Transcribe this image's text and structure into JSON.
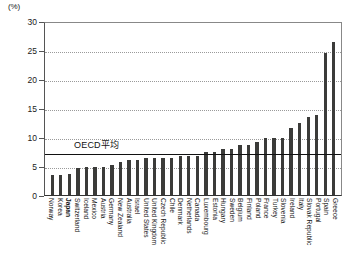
{
  "axis": {
    "unit": "(%)",
    "y_ticks": [
      "30",
      "25",
      "20",
      "15",
      "10",
      "5",
      "0"
    ]
  },
  "annotation": {
    "oecd_average_label": "OECD平均"
  },
  "chart_data": {
    "type": "bar",
    "title": "",
    "xlabel": "",
    "ylabel": "(%)",
    "ylim": [
      0,
      30
    ],
    "grid": true,
    "legend": null,
    "highlight_category": "Japan",
    "annotations": [
      {
        "label": "OECD平均",
        "type": "hline",
        "value": 7.4
      }
    ],
    "categories": [
      "Norway",
      "Korea",
      "Japan",
      "Switzerland",
      "Iceland",
      "Mexico",
      "Austria",
      "Germany",
      "New Zealand",
      "Australia",
      "Israel",
      "United States",
      "United Kingdom",
      "Czech Republic",
      "Chile",
      "Denmark",
      "Netherlands",
      "Canada",
      "Luxembourg",
      "Estonia",
      "Hungary",
      "Sweden",
      "Belgium",
      "Finland",
      "Poland",
      "France",
      "Turkey",
      "Slovenia",
      "Ireland",
      "Italy",
      "Slovak Republic",
      "Portugal",
      "Spain",
      "Greece"
    ],
    "values": [
      3.4,
      3.5,
      3.6,
      4.6,
      4.9,
      4.9,
      4.9,
      5.2,
      5.7,
      6.1,
      6.1,
      6.3,
      6.4,
      6.4,
      6.4,
      6.7,
      6.8,
      6.8,
      7.4,
      7.5,
      7.9,
      7.9,
      8.6,
      8.6,
      9.2,
      9.9,
      9.9,
      9.9,
      11.5,
      12.4,
      13.5,
      13.8,
      24.4,
      26.3
    ]
  }
}
